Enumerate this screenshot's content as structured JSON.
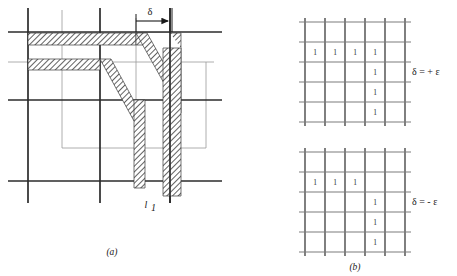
{
  "figure": {
    "panels": [
      {
        "id": "a",
        "caption": "(a)",
        "labels": {
          "delta_arrow": "δ",
          "line_label": "l",
          "line_label_sub": "1"
        }
      },
      {
        "id": "b",
        "caption": "(b)",
        "grids": [
          {
            "name": "grid-plus",
            "label": "δ = + ε",
            "rows": 5,
            "cols": 5,
            "values": [
              [
                "",
                "",
                "",
                "",
                ""
              ],
              [
                "1",
                "1",
                "1",
                "1",
                ""
              ],
              [
                "",
                "",
                "",
                "1",
                ""
              ],
              [
                "",
                "",
                "",
                "1",
                ""
              ],
              [
                "",
                "",
                "",
                "1",
                ""
              ]
            ]
          },
          {
            "name": "grid-minus",
            "label": "δ = - ε",
            "rows": 5,
            "cols": 5,
            "values": [
              [
                "",
                "",
                "",
                "",
                ""
              ],
              [
                "1",
                "1",
                "1",
                "",
                ""
              ],
              [
                "",
                "",
                "",
                "1",
                ""
              ],
              [
                "",
                "",
                "",
                "1",
                ""
              ],
              [
                "",
                "",
                "",
                "1",
                ""
              ]
            ]
          }
        ]
      }
    ],
    "colors": {
      "grid_dark": "#2b2b2b",
      "grid_light": "#9a9a9a",
      "hatch": "#3a3a3a",
      "text": "#1a1a1a",
      "background": "#ffffff"
    }
  }
}
